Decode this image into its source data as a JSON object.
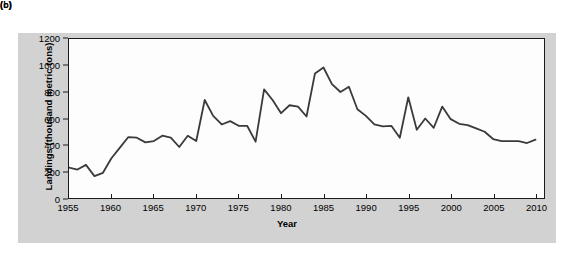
{
  "panels": {
    "upper_label": "(b)",
    "lower_label": "(c)"
  },
  "colors": {
    "panel_background": "#d2d2d2",
    "plot_background": "#fdfdfd",
    "axis": "#1a1a1a",
    "line": "#3a3a3a",
    "text": "#000000"
  },
  "chart_data": {
    "type": "line",
    "title": "",
    "xlabel": "Year",
    "ylabel": "Landings (thousand metric tons)",
    "xlim": [
      1955,
      2011
    ],
    "ylim": [
      0,
      1200
    ],
    "xticks": [
      1955,
      1960,
      1965,
      1970,
      1975,
      1980,
      1985,
      1990,
      1995,
      2000,
      2005,
      2010
    ],
    "yticks": [
      0,
      200,
      400,
      600,
      800,
      1000,
      1200
    ],
    "grid": false,
    "legend": null,
    "series": [
      {
        "name": "Landings",
        "x": [
          1955,
          1956,
          1957,
          1958,
          1959,
          1960,
          1961,
          1962,
          1963,
          1964,
          1965,
          1966,
          1967,
          1968,
          1969,
          1970,
          1971,
          1972,
          1973,
          1974,
          1975,
          1976,
          1977,
          1978,
          1979,
          1980,
          1981,
          1982,
          1983,
          1984,
          1985,
          1986,
          1987,
          1988,
          1989,
          1990,
          1991,
          1992,
          1993,
          1994,
          1995,
          1996,
          1997,
          1998,
          1999,
          2000,
          2001,
          2002,
          2003,
          2004,
          2005,
          2006,
          2007,
          2008,
          2009,
          2010
        ],
        "values": [
          230,
          215,
          250,
          165,
          190,
          300,
          380,
          460,
          455,
          420,
          430,
          470,
          455,
          385,
          470,
          430,
          740,
          620,
          555,
          580,
          545,
          545,
          425,
          820,
          740,
          640,
          700,
          690,
          615,
          940,
          985,
          860,
          800,
          840,
          670,
          620,
          555,
          540,
          545,
          455,
          760,
          515,
          600,
          530,
          690,
          595,
          560,
          550,
          525,
          500,
          445,
          430,
          430,
          430,
          415,
          440
        ]
      }
    ]
  }
}
